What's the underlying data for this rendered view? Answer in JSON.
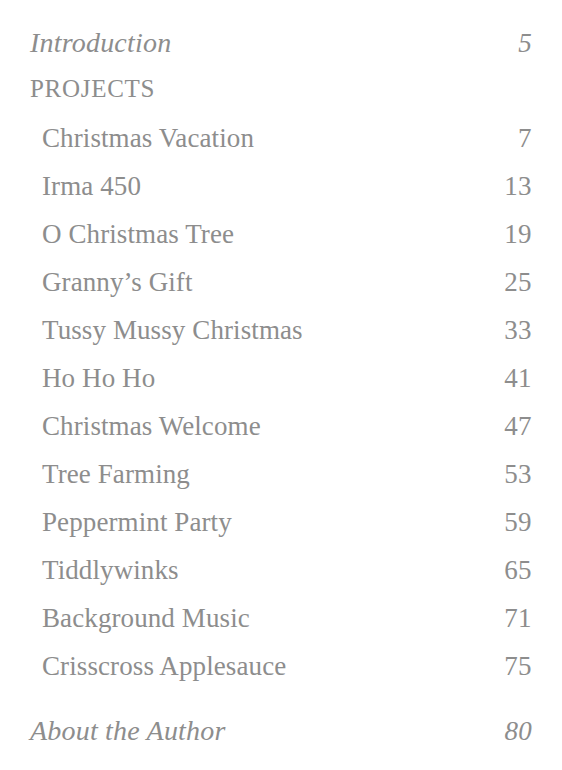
{
  "page": {
    "background_color": "#ffffff",
    "text_color": "#8d8d8d"
  },
  "contents": {
    "front_matter": {
      "title": "Introduction",
      "page": "5"
    },
    "section": {
      "label": "PROJECTS"
    },
    "entries": [
      {
        "title": "Christmas Vacation",
        "page": "7"
      },
      {
        "title": "Irma 450",
        "page": "13"
      },
      {
        "title": "O Christmas Tree",
        "page": "19"
      },
      {
        "title": "Granny’s Gift",
        "page": "25"
      },
      {
        "title": "Tussy Mussy Christmas",
        "page": "33"
      },
      {
        "title": "Ho Ho Ho",
        "page": "41"
      },
      {
        "title": "Christmas Welcome",
        "page": "47"
      },
      {
        "title": "Tree Farming",
        "page": "53"
      },
      {
        "title": "Peppermint Party",
        "page": "59"
      },
      {
        "title": "Tiddlywinks",
        "page": "65"
      },
      {
        "title": "Background Music",
        "page": "71"
      },
      {
        "title": "Crisscross Applesauce",
        "page": "75"
      }
    ],
    "back_matter": {
      "title": "About the Author",
      "page": "80"
    }
  }
}
